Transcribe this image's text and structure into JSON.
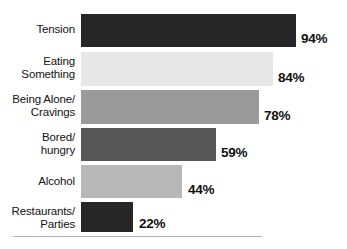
{
  "chart_data": {
    "type": "bar",
    "orientation": "horizontal",
    "title": "",
    "subtitle": "",
    "xlabel": "",
    "ylabel": "",
    "xlim": [
      0,
      100
    ],
    "grid": false,
    "legend": false,
    "value_suffix": "%",
    "categories": [
      "Tension",
      "Eating\nSomething",
      "Being Alone/\nCravings",
      "Bored/\nhungry",
      "Alcohol",
      "Restaurants/\nParties"
    ],
    "values": [
      94,
      84,
      78,
      59,
      44,
      22
    ],
    "value_labels": [
      "94%",
      "84%",
      "78%",
      "59%",
      "44%",
      "22%"
    ],
    "bar_colors": [
      "#262626",
      "#e8e8e8",
      "#9a9a9a",
      "#575757",
      "#b8b8b8",
      "#262626"
    ],
    "bars": [
      {
        "label": "Tension",
        "value": 94,
        "value_label": "94%",
        "color": "#262626",
        "top": 14,
        "height": 33,
        "width": 215,
        "label_top": 23,
        "value_left": 301,
        "value_top": 31
      },
      {
        "label": "Eating\nSomething",
        "value": 84,
        "value_label": "84%",
        "color": "#e8e8e8",
        "top": 52,
        "height": 34,
        "width": 192,
        "label_top": 55,
        "value_left": 278,
        "value_top": 70
      },
      {
        "label": "Being Alone/\nCravings",
        "value": 78,
        "value_label": "78%",
        "color": "#9a9a9a",
        "top": 90,
        "height": 34,
        "width": 178,
        "label_top": 93,
        "value_left": 264,
        "value_top": 108
      },
      {
        "label": "Bored/\nhungry",
        "value": 59,
        "value_label": "59%",
        "color": "#575757",
        "top": 128,
        "height": 33,
        "width": 135,
        "label_top": 131,
        "value_left": 221,
        "value_top": 145
      },
      {
        "label": "Alcohol",
        "value": 44,
        "value_label": "44%",
        "color": "#b8b8b8",
        "top": 165,
        "height": 33,
        "width": 101,
        "label_top": 175,
        "value_left": 188,
        "value_top": 182
      },
      {
        "label": "Restaurants/\nParties",
        "value": 22,
        "value_label": "22%",
        "color": "#262626",
        "top": 202,
        "height": 30,
        "width": 52,
        "label_top": 205,
        "value_left": 139,
        "value_top": 216
      }
    ]
  }
}
